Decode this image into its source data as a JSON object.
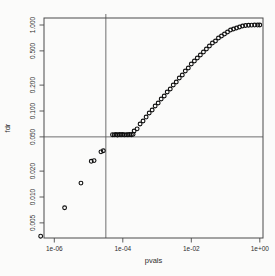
{
  "chart_data": {
    "type": "scatter",
    "title": "",
    "xlabel": "pvals",
    "ylabel": "fdr",
    "x_scale": "log",
    "y_scale": "log",
    "x_range": [
      4e-07,
      1.2
    ],
    "y_range": [
      0.0033,
      1.2
    ],
    "grid": false,
    "legend": "none",
    "marker": "open-circle",
    "x_ticks": [
      {
        "value": 1e-06,
        "label": "1e-06"
      },
      {
        "value": 0.0001,
        "label": "1e-04"
      },
      {
        "value": 0.01,
        "label": "1e-02"
      },
      {
        "value": 1.0,
        "label": "1e+00"
      }
    ],
    "y_ticks": [
      {
        "value": 0.005,
        "label": "0.005"
      },
      {
        "value": 0.01,
        "label": "0.010"
      },
      {
        "value": 0.02,
        "label": "0.020"
      },
      {
        "value": 0.05,
        "label": "0.050"
      },
      {
        "value": 0.1,
        "label": "0.100"
      },
      {
        "value": 0.2,
        "label": "0.200"
      },
      {
        "value": 0.5,
        "label": "0.500"
      },
      {
        "value": 1.0,
        "label": "1.000"
      }
    ],
    "reference_lines": {
      "horizontal_fdr": 0.05,
      "vertical_pval": 3.2e-05
    },
    "colors": {
      "points": "#0d0d0d",
      "reference_lines": "#606060",
      "axis": "#4a4a4a",
      "text": "#2e2e2e",
      "background": "#fbfbfa"
    },
    "points": [
      [
        4e-07,
        0.0035
      ],
      [
        2e-06,
        0.0075
      ],
      [
        6e-06,
        0.0145
      ],
      [
        1.2e-05,
        0.026
      ],
      [
        1.45e-05,
        0.0265
      ],
      [
        2.3e-05,
        0.0335
      ],
      [
        2.7e-05,
        0.0345
      ],
      [
        5e-05,
        0.053
      ],
      [
        5.6e-05,
        0.0528
      ],
      [
        6.3e-05,
        0.0532
      ],
      [
        7e-05,
        0.0526
      ],
      [
        7.9e-05,
        0.0534
      ],
      [
        8.9e-05,
        0.0529
      ],
      [
        0.0001,
        0.0533
      ],
      [
        0.000112,
        0.0527
      ],
      [
        0.000126,
        0.0531
      ],
      [
        0.000141,
        0.0529
      ],
      [
        0.000158,
        0.0534
      ],
      [
        0.000178,
        0.053
      ],
      [
        0.0002,
        0.0536
      ],
      [
        0.000214,
        0.0585
      ],
      [
        0.000262,
        0.062
      ],
      [
        0.00032,
        0.0706
      ],
      [
        0.00039,
        0.0765
      ],
      [
        0.00048,
        0.0851
      ],
      [
        0.00059,
        0.0948
      ],
      [
        0.00072,
        0.1027
      ],
      [
        0.00088,
        0.1143
      ],
      [
        0.00108,
        0.1239
      ],
      [
        0.00132,
        0.1379
      ],
      [
        0.00162,
        0.1494
      ],
      [
        0.00198,
        0.1663
      ],
      [
        0.00243,
        0.1802
      ],
      [
        0.00297,
        0.2006
      ],
      [
        0.00364,
        0.2174
      ],
      [
        0.00446,
        0.242
      ],
      [
        0.00546,
        0.2621
      ],
      [
        0.00668,
        0.2918
      ],
      [
        0.00818,
        0.3162
      ],
      [
        0.01,
        0.352
      ],
      [
        0.0123,
        0.3814
      ],
      [
        0.015,
        0.4133
      ],
      [
        0.0184,
        0.4479
      ],
      [
        0.0226,
        0.4853
      ],
      [
        0.0276,
        0.5259
      ],
      [
        0.0338,
        0.5699
      ],
      [
        0.0414,
        0.6176
      ],
      [
        0.0507,
        0.6516
      ],
      [
        0.0621,
        0.706
      ],
      [
        0.0761,
        0.7449
      ],
      [
        0.0931,
        0.7858
      ],
      [
        0.114,
        0.829
      ],
      [
        0.14,
        0.8747
      ],
      [
        0.171,
        0.8984
      ],
      [
        0.209,
        0.9226
      ],
      [
        0.256,
        0.9475
      ],
      [
        0.314,
        0.9731
      ],
      [
        0.384,
        0.9861
      ],
      [
        0.47,
        0.993
      ],
      [
        0.576,
        0.996
      ],
      [
        0.705,
        0.998
      ],
      [
        0.863,
        0.999
      ],
      [
        1.0,
        1.0
      ]
    ]
  }
}
